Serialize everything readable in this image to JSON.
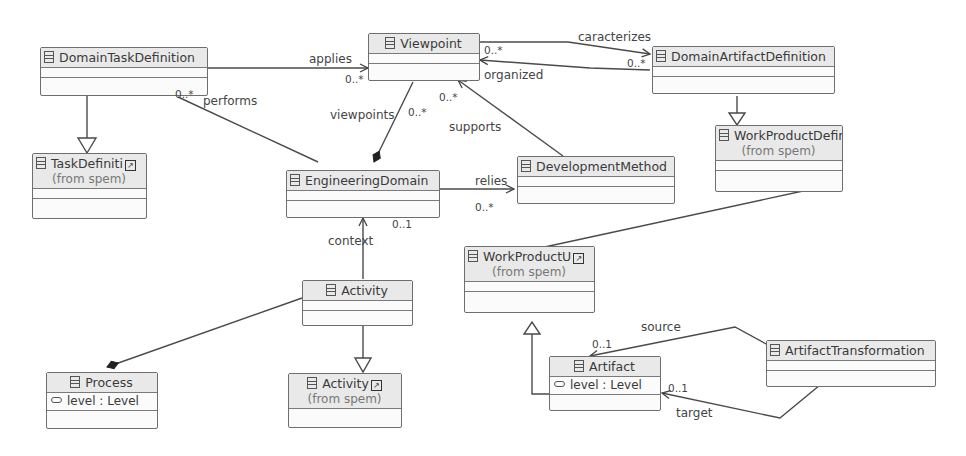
{
  "diagram": {
    "type": "UML class diagram",
    "classes": {
      "domain_task_definition": {
        "name": "DomainTaskDefinition"
      },
      "viewpoint": {
        "name": "Viewpoint"
      },
      "domain_artifact_definition": {
        "name": "DomainArtifactDefinition"
      },
      "task_definition": {
        "name": "TaskDefiniti",
        "origin": "(from spem)"
      },
      "engineering_domain": {
        "name": "EngineeringDomain"
      },
      "development_method": {
        "name": "DevelopmentMethod"
      },
      "work_product_definition": {
        "name": "WorkProductDefiniti",
        "origin": "(from spem)"
      },
      "work_product_use": {
        "name": "WorkProductU",
        "origin": "(from spem)"
      },
      "activity": {
        "name": "Activity"
      },
      "spem_activity": {
        "name": "Activity",
        "origin": "(from spem)"
      },
      "process": {
        "name": "Process",
        "attribute": "level : Level"
      },
      "artifact": {
        "name": "Artifact",
        "attribute": "level : Level"
      },
      "artifact_transformation": {
        "name": "ArtifactTransformation"
      }
    },
    "associations": {
      "applies": {
        "label": "applies",
        "multiplicity": "0..*"
      },
      "performs": {
        "label": "performs",
        "multiplicity": "0..*"
      },
      "caracterizes": {
        "label": "caracterizes",
        "multiplicity": "0..*"
      },
      "organized": {
        "label": "organized",
        "multiplicity": "0..*"
      },
      "viewpoints": {
        "label": "viewpoints",
        "multiplicity": "0..*"
      },
      "supports": {
        "label": "supports",
        "multiplicity": "0..*"
      },
      "relies": {
        "label": "relies",
        "multiplicity": "0..*"
      },
      "context": {
        "label": "context",
        "multiplicity": "0..1"
      },
      "source": {
        "label": "source",
        "multiplicity": "0..1"
      },
      "target": {
        "label": "target",
        "multiplicity": "0..1"
      }
    },
    "icons": {
      "class": "class-icon",
      "external": "external-link-icon",
      "attribute": "attribute-icon"
    },
    "link_glyph": "↗"
  }
}
